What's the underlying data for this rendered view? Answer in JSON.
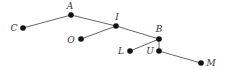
{
  "diagram": {
    "type": "tree",
    "nodes": [
      {
        "id": "C",
        "label": "C",
        "x": 23,
        "y": 28,
        "lx": 14,
        "ly": 31,
        "anchor": "middle"
      },
      {
        "id": "A",
        "label": "A",
        "x": 71,
        "y": 15,
        "lx": 70,
        "ly": 9,
        "anchor": "middle"
      },
      {
        "id": "I",
        "label": "I",
        "x": 116,
        "y": 26,
        "lx": 117,
        "ly": 20,
        "anchor": "middle"
      },
      {
        "id": "O",
        "label": "O",
        "x": 81,
        "y": 39,
        "lx": 71,
        "ly": 43,
        "anchor": "middle"
      },
      {
        "id": "B",
        "label": "B",
        "x": 159,
        "y": 39,
        "lx": 159,
        "ly": 32,
        "anchor": "middle"
      },
      {
        "id": "L",
        "label": "L",
        "x": 130,
        "y": 51,
        "lx": 121,
        "ly": 54,
        "anchor": "middle"
      },
      {
        "id": "U",
        "label": "U",
        "x": 159,
        "y": 51,
        "lx": 150,
        "ly": 54,
        "anchor": "middle"
      },
      {
        "id": "M",
        "label": "M",
        "x": 201,
        "y": 63,
        "lx": 211,
        "ly": 66,
        "anchor": "middle"
      }
    ],
    "edges": [
      [
        "C",
        "A"
      ],
      [
        "A",
        "I"
      ],
      [
        "I",
        "O"
      ],
      [
        "I",
        "B"
      ],
      [
        "B",
        "L"
      ],
      [
        "B",
        "U"
      ],
      [
        "U",
        "M"
      ]
    ],
    "colors": {
      "edge": "#555555",
      "node": "#111111",
      "label": "#333333"
    }
  }
}
